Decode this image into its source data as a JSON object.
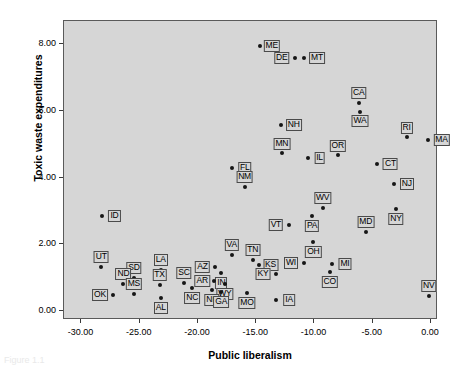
{
  "chart_data": {
    "type": "scatter",
    "title": "",
    "xlabel": "Public liberalism",
    "ylabel": "Toxic waste expenditures",
    "xlim": [
      -31.5,
      0.6
    ],
    "ylim": [
      -0.27,
      8.7
    ],
    "xticks": [
      -30.0,
      -25.0,
      -20.0,
      -15.0,
      -10.0,
      -5.0,
      0.0
    ],
    "xticklabels": [
      "-30.00",
      "-25.00",
      "-20.00",
      "-15.00",
      "-10.00",
      "-5.00",
      "0.00"
    ],
    "yticks": [
      0.0,
      2.0,
      4.0,
      6.0,
      8.0
    ],
    "yticklabels": [
      "0.00",
      "2.00",
      "4.00",
      "6.00",
      "8.00"
    ],
    "grid": false,
    "legend": null,
    "marker_color": "#161616",
    "plot_background": "#d6d6d6",
    "points": [
      {
        "label": "ME",
        "x": -14.7,
        "y": 7.95,
        "lx": 12,
        "ly": 0
      },
      {
        "label": "DE",
        "x": -11.7,
        "y": 7.6,
        "lx": -13,
        "ly": 0
      },
      {
        "label": "MT",
        "x": -10.9,
        "y": 7.6,
        "lx": 13,
        "ly": 0
      },
      {
        "label": "CA",
        "x": -6.2,
        "y": 6.25,
        "lx": 0,
        "ly": -10
      },
      {
        "label": "WA",
        "x": -6.1,
        "y": 5.97,
        "lx": 0,
        "ly": 9
      },
      {
        "label": "NH",
        "x": -12.9,
        "y": 5.57,
        "lx": 13,
        "ly": 0
      },
      {
        "label": "RI",
        "x": -2.1,
        "y": 5.23,
        "lx": 0,
        "ly": -9
      },
      {
        "label": "MA",
        "x": -0.3,
        "y": 5.12,
        "lx": 14,
        "ly": 0
      },
      {
        "label": "MN",
        "x": -12.8,
        "y": 4.75,
        "lx": 0,
        "ly": -9
      },
      {
        "label": "OR",
        "x": -8.0,
        "y": 4.68,
        "lx": 0,
        "ly": -9
      },
      {
        "label": "IL",
        "x": -10.6,
        "y": 4.58,
        "lx": 12,
        "ly": 0
      },
      {
        "label": "CT",
        "x": -4.6,
        "y": 4.42,
        "lx": 13,
        "ly": 0
      },
      {
        "label": "FL",
        "x": -17.1,
        "y": 4.3,
        "lx": 13,
        "ly": 0
      },
      {
        "label": "NJ",
        "x": -3.2,
        "y": 3.8,
        "lx": 13,
        "ly": 0
      },
      {
        "label": "NM",
        "x": -16.0,
        "y": 3.72,
        "lx": 0,
        "ly": -10
      },
      {
        "label": "WV",
        "x": -9.3,
        "y": 3.08,
        "lx": 0,
        "ly": -10
      },
      {
        "label": "NY",
        "x": -3.0,
        "y": 3.05,
        "lx": 0,
        "ly": 10
      },
      {
        "label": "ID",
        "x": -28.2,
        "y": 2.85,
        "lx": 12,
        "ly": 0
      },
      {
        "label": "PA",
        "x": -10.2,
        "y": 2.86,
        "lx": 0,
        "ly": 10
      },
      {
        "label": "VT",
        "x": -12.2,
        "y": 2.57,
        "lx": -13,
        "ly": 0
      },
      {
        "label": "MD",
        "x": -5.6,
        "y": 2.37,
        "lx": 0,
        "ly": -10
      },
      {
        "label": "OH",
        "x": -10.1,
        "y": 2.08,
        "lx": 0,
        "ly": 10
      },
      {
        "label": "VA",
        "x": -17.1,
        "y": 1.67,
        "lx": 0,
        "ly": -10
      },
      {
        "label": "TN",
        "x": -15.3,
        "y": 1.53,
        "lx": 0,
        "ly": -10
      },
      {
        "label": "WI",
        "x": -10.9,
        "y": 1.45,
        "lx": -13,
        "ly": 0
      },
      {
        "label": "MI",
        "x": -8.5,
        "y": 1.42,
        "lx": 13,
        "ly": 0
      },
      {
        "label": "KS",
        "x": -14.8,
        "y": 1.38,
        "lx": 12,
        "ly": 0
      },
      {
        "label": "UT",
        "x": -28.3,
        "y": 1.33,
        "lx": 0,
        "ly": -10
      },
      {
        "label": "AZ",
        "x": -18.5,
        "y": 1.33,
        "lx": -13,
        "ly": 0
      },
      {
        "label": "LA",
        "x": -23.2,
        "y": 1.22,
        "lx": 0,
        "ly": -10
      },
      {
        "label": "CO",
        "x": -8.7,
        "y": 1.18,
        "lx": 0,
        "ly": 10
      },
      {
        "label": "IN",
        "x": -18.0,
        "y": 1.15,
        "lx": 0,
        "ly": 10
      },
      {
        "label": "KY",
        "x": -13.3,
        "y": 1.1,
        "lx": -13,
        "ly": 0
      },
      {
        "label": "SD",
        "x": -25.5,
        "y": 1.0,
        "lx": 0,
        "ly": -10
      },
      {
        "label": "AR",
        "x": -18.6,
        "y": 0.9,
        "lx": -12,
        "ly": 0
      },
      {
        "label": "SC",
        "x": -21.2,
        "y": 0.83,
        "lx": 0,
        "ly": -10
      },
      {
        "label": "ND",
        "x": -26.4,
        "y": 0.81,
        "lx": 0,
        "ly": -10
      },
      {
        "label": "WY",
        "x": -17.7,
        "y": 0.8,
        "lx": 0,
        "ly": 10
      },
      {
        "label": "TX",
        "x": -23.3,
        "y": 0.77,
        "lx": 0,
        "ly": -10
      },
      {
        "label": "NC",
        "x": -20.5,
        "y": 0.68,
        "lx": 0,
        "ly": 10
      },
      {
        "label": "NE",
        "x": -18.8,
        "y": 0.63,
        "lx": 0,
        "ly": 10
      },
      {
        "label": "MS",
        "x": -25.5,
        "y": 0.5,
        "lx": 0,
        "ly": -10
      },
      {
        "label": "GA",
        "x": -18.0,
        "y": 0.57,
        "lx": 0,
        "ly": 10
      },
      {
        "label": "MO",
        "x": -15.8,
        "y": 0.55,
        "lx": 0,
        "ly": 10
      },
      {
        "label": "OK",
        "x": -27.3,
        "y": 0.48,
        "lx": -13,
        "ly": 0
      },
      {
        "label": "NV",
        "x": -0.2,
        "y": 0.45,
        "lx": 0,
        "ly": -10
      },
      {
        "label": "AL",
        "x": -23.2,
        "y": 0.38,
        "lx": 0,
        "ly": 10
      },
      {
        "label": "IA",
        "x": -13.3,
        "y": 0.33,
        "lx": 13,
        "ly": 0
      }
    ]
  },
  "caption": {
    "text": "Figure 1.1"
  }
}
